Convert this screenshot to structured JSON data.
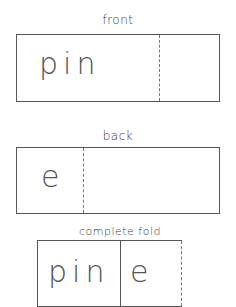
{
  "sections": [
    {
      "label": "front",
      "word": "pin"
    },
    {
      "label": "back",
      "word": "e"
    },
    {
      "label": "complete fold",
      "word_left": "pin",
      "word_right": "e"
    }
  ]
}
